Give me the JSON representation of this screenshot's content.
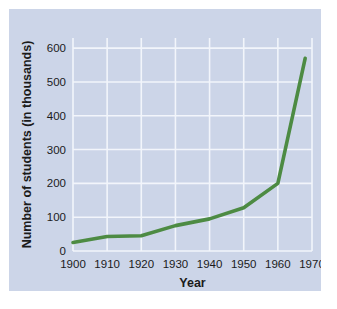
{
  "figure": {
    "background_color": "#ffffff",
    "panel_color": "#ccd5e8",
    "gridline_color": "#f2f5fb",
    "series_color": "#4d8b43"
  },
  "chart_data": {
    "type": "line",
    "title": "",
    "xlabel": "Year",
    "ylabel": "Number of students (in thousands)",
    "xlim": [
      1900,
      1970
    ],
    "ylim": [
      0,
      630
    ],
    "grid": true,
    "legend": "none",
    "x_ticks": [
      1900,
      1910,
      1920,
      1930,
      1940,
      1950,
      1960,
      1970
    ],
    "x_tick_labels": [
      "1900",
      "1910",
      "1920",
      "1930",
      "1940",
      "1950",
      "1960",
      "1970"
    ],
    "y_ticks": [
      0,
      100,
      200,
      300,
      400,
      500,
      600
    ],
    "y_tick_labels": [
      "0",
      "100",
      "200",
      "300",
      "400",
      "500",
      "600"
    ],
    "series": [
      {
        "name": "Number of students",
        "color": "#4d8b43",
        "x": [
          1900,
          1910,
          1920,
          1930,
          1940,
          1950,
          1960,
          1968
        ],
        "values": [
          25,
          43,
          45,
          75,
          95,
          128,
          200,
          570
        ]
      }
    ]
  }
}
